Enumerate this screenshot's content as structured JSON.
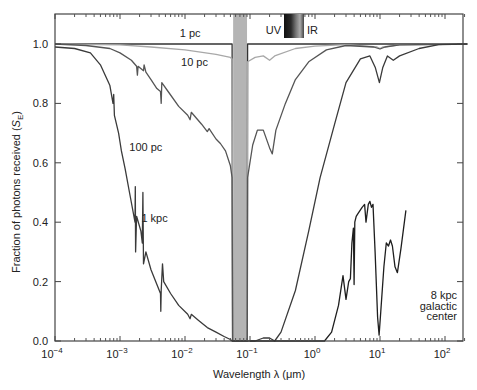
{
  "chart_data": {
    "type": "line",
    "title": "",
    "xlabel": "Wavelength λ (μm)",
    "ylabel": "Fraction of photons received (S_E)",
    "ylabel_main": "Fraction of photons received (",
    "ylabel_sym": "S",
    "ylabel_sub": "E",
    "ylabel_end": ")",
    "xscale": "log",
    "xlim": [
      0.0001,
      220
    ],
    "ylim": [
      0.0,
      1.1
    ],
    "grid": false,
    "x_ticks": [
      {
        "value": 0.0001,
        "base": "10",
        "exp": "−4"
      },
      {
        "value": 0.001,
        "base": "10",
        "exp": "−3"
      },
      {
        "value": 0.01,
        "base": "10",
        "exp": "−2"
      },
      {
        "value": 0.1,
        "base": "10",
        "exp": "−1"
      },
      {
        "value": 1,
        "base": "10",
        "exp": "0"
      },
      {
        "value": 10,
        "base": "10",
        "exp": "1"
      },
      {
        "value": 100,
        "base": "10",
        "exp": "2"
      }
    ],
    "y_ticks": [
      "0.0",
      "0.2",
      "0.4",
      "0.6",
      "0.8",
      "1.0"
    ],
    "shaded_band": {
      "x_start": 0.055,
      "x_end": 0.09,
      "color": "#b4b4b4",
      "label": "ionizing UV (opaque)"
    },
    "uv_ir_bar": {
      "left_label": "UV",
      "right_label": "IR"
    },
    "annotations": [
      {
        "text": "1 pc",
        "x": 0.012,
        "y": 1.025
      },
      {
        "text": "10 pc",
        "x": 0.014,
        "y": 0.925
      },
      {
        "text": "100 pc",
        "x": 0.0025,
        "y": 0.64
      },
      {
        "text": "1 kpc",
        "x": 0.0034,
        "y": 0.4
      },
      {
        "text": "8 kpc",
        "x": 150,
        "y": 0.14
      },
      {
        "text": "galactic",
        "x": 150,
        "y": 0.105
      },
      {
        "text": "center",
        "x": 150,
        "y": 0.07
      }
    ],
    "series": [
      {
        "name": "1 pc",
        "color": "#333333",
        "points": [
          [
            0.0001,
            1.0
          ],
          [
            0.053,
            1.0
          ],
          [
            0.054,
            0.0
          ],
          [
            0.091,
            0.0
          ],
          [
            0.092,
            1.0
          ],
          [
            220,
            1.0
          ]
        ]
      },
      {
        "name": "10 pc",
        "color": "#a8a8a8",
        "points": [
          [
            0.0001,
            1.0
          ],
          [
            0.001,
            0.997
          ],
          [
            0.003,
            0.99
          ],
          [
            0.01,
            0.98
          ],
          [
            0.03,
            0.965
          ],
          [
            0.05,
            0.955
          ],
          [
            0.053,
            0.95
          ],
          [
            0.054,
            0.0
          ],
          [
            0.091,
            0.0
          ],
          [
            0.092,
            0.94
          ],
          [
            0.12,
            0.955
          ],
          [
            0.16,
            0.96
          ],
          [
            0.2,
            0.945
          ],
          [
            0.24,
            0.96
          ],
          [
            0.5,
            0.985
          ],
          [
            1.0,
            0.993
          ],
          [
            3,
            0.998
          ],
          [
            9,
            0.99
          ],
          [
            10,
            0.985
          ],
          [
            11,
            0.99
          ],
          [
            20,
            0.997
          ],
          [
            220,
            1.0
          ]
        ]
      },
      {
        "name": "100 pc",
        "color": "#555555",
        "points": [
          [
            0.0001,
            1.0
          ],
          [
            0.0003,
            0.995
          ],
          [
            0.0007,
            0.985
          ],
          [
            0.001,
            0.97
          ],
          [
            0.0015,
            0.945
          ],
          [
            0.0018,
            0.925
          ],
          [
            0.00185,
            0.895
          ],
          [
            0.0019,
            0.925
          ],
          [
            0.0023,
            0.91
          ],
          [
            0.00235,
            0.93
          ],
          [
            0.0025,
            0.905
          ],
          [
            0.003,
            0.88
          ],
          [
            0.0037,
            0.85
          ],
          [
            0.0042,
            0.84
          ],
          [
            0.0043,
            0.8
          ],
          [
            0.0044,
            0.87
          ],
          [
            0.0055,
            0.84
          ],
          [
            0.008,
            0.79
          ],
          [
            0.011,
            0.76
          ],
          [
            0.012,
            0.745
          ],
          [
            0.0125,
            0.77
          ],
          [
            0.018,
            0.73
          ],
          [
            0.022,
            0.705
          ],
          [
            0.0235,
            0.715
          ],
          [
            0.03,
            0.68
          ],
          [
            0.035,
            0.665
          ],
          [
            0.042,
            0.64
          ],
          [
            0.05,
            0.59
          ],
          [
            0.053,
            0.55
          ],
          [
            0.054,
            0.0
          ],
          [
            0.091,
            0.0
          ],
          [
            0.092,
            0.55
          ],
          [
            0.11,
            0.66
          ],
          [
            0.13,
            0.71
          ],
          [
            0.16,
            0.71
          ],
          [
            0.2,
            0.65
          ],
          [
            0.22,
            0.63
          ],
          [
            0.25,
            0.71
          ],
          [
            0.35,
            0.8
          ],
          [
            0.5,
            0.88
          ],
          [
            0.8,
            0.94
          ],
          [
            1.5,
            0.98
          ],
          [
            3,
            0.995
          ],
          [
            8,
            0.99
          ],
          [
            10,
            0.983
          ],
          [
            12,
            0.99
          ],
          [
            20,
            0.997
          ],
          [
            220,
            1.0
          ]
        ]
      },
      {
        "name": "1 kpc",
        "color": "#3a3a3a",
        "points": [
          [
            0.0001,
            0.99
          ],
          [
            0.0002,
            0.985
          ],
          [
            0.00035,
            0.97
          ],
          [
            0.0005,
            0.93
          ],
          [
            0.0007,
            0.86
          ],
          [
            0.00078,
            0.8
          ],
          [
            0.0008,
            0.83
          ],
          [
            0.00082,
            0.76
          ],
          [
            0.00095,
            0.7
          ],
          [
            0.001,
            0.67
          ],
          [
            0.00105,
            0.64
          ],
          [
            0.0012,
            0.58
          ],
          [
            0.0014,
            0.5
          ],
          [
            0.0017,
            0.4
          ],
          [
            0.00172,
            0.52
          ],
          [
            0.00174,
            0.3
          ],
          [
            0.0018,
            0.42
          ],
          [
            0.0021,
            0.37
          ],
          [
            0.0022,
            0.33
          ],
          [
            0.00225,
            0.5
          ],
          [
            0.0023,
            0.26
          ],
          [
            0.0025,
            0.3
          ],
          [
            0.003,
            0.24
          ],
          [
            0.0037,
            0.19
          ],
          [
            0.0042,
            0.16
          ],
          [
            0.00425,
            0.1
          ],
          [
            0.0043,
            0.17
          ],
          [
            0.0045,
            0.26
          ],
          [
            0.0047,
            0.2
          ],
          [
            0.006,
            0.16
          ],
          [
            0.008,
            0.12
          ],
          [
            0.011,
            0.09
          ],
          [
            0.012,
            0.075
          ],
          [
            0.0125,
            0.09
          ],
          [
            0.016,
            0.07
          ],
          [
            0.022,
            0.045
          ],
          [
            0.03,
            0.03
          ],
          [
            0.04,
            0.015
          ],
          [
            0.05,
            0.005
          ],
          [
            0.053,
            0.0
          ],
          [
            0.091,
            0.0
          ],
          [
            0.12,
            0.0
          ],
          [
            0.16,
            0.01
          ],
          [
            0.2,
            0.01
          ],
          [
            0.24,
            0.0
          ],
          [
            0.3,
            0.03
          ],
          [
            0.5,
            0.17
          ],
          [
            0.8,
            0.37
          ],
          [
            1.2,
            0.55
          ],
          [
            2,
            0.73
          ],
          [
            3,
            0.87
          ],
          [
            5,
            0.95
          ],
          [
            7,
            0.96
          ],
          [
            8.5,
            0.92
          ],
          [
            9.8,
            0.87
          ],
          [
            11,
            0.92
          ],
          [
            13,
            0.96
          ],
          [
            16,
            0.945
          ],
          [
            20,
            0.96
          ],
          [
            40,
            0.985
          ],
          [
            80,
            0.998
          ],
          [
            220,
            1.0
          ]
        ]
      },
      {
        "name": "8 kpc galactic center",
        "color": "#1e1e1e",
        "points": [
          [
            0.1,
            0.0
          ],
          [
            1.0,
            0.0
          ],
          [
            1.4,
            0.0
          ],
          [
            1.8,
            0.03
          ],
          [
            2.3,
            0.12
          ],
          [
            2.7,
            0.22
          ],
          [
            3.0,
            0.14
          ],
          [
            3.3,
            0.2
          ],
          [
            3.5,
            0.21
          ],
          [
            3.7,
            0.33
          ],
          [
            3.9,
            0.38
          ],
          [
            4.0,
            0.19
          ],
          [
            4.1,
            0.4
          ],
          [
            4.3,
            0.42
          ],
          [
            4.6,
            0.43
          ],
          [
            5.3,
            0.45
          ],
          [
            5.8,
            0.46
          ],
          [
            6.1,
            0.4
          ],
          [
            6.6,
            0.46
          ],
          [
            7.0,
            0.47
          ],
          [
            7.4,
            0.45
          ],
          [
            7.8,
            0.46
          ],
          [
            8.4,
            0.3
          ],
          [
            9.2,
            0.08
          ],
          [
            9.7,
            0.02
          ],
          [
            10.3,
            0.1
          ],
          [
            11.5,
            0.25
          ],
          [
            12.5,
            0.33
          ],
          [
            13.5,
            0.32
          ],
          [
            14.5,
            0.34
          ],
          [
            15.5,
            0.32
          ],
          [
            17,
            0.25
          ],
          [
            18.5,
            0.23
          ],
          [
            21,
            0.31
          ],
          [
            25,
            0.44
          ]
        ]
      }
    ]
  }
}
